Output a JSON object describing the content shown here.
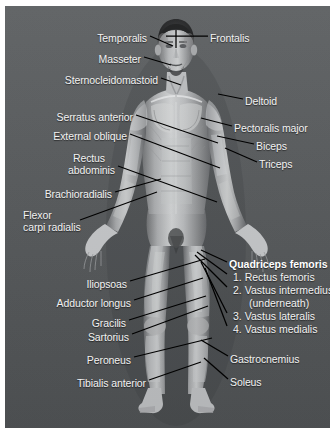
{
  "image": {
    "type": "anatomical-illustration",
    "subject": "human-muscular-system-anterior-view",
    "background_color": "#55585a",
    "border_color": "#ffffff",
    "label_color": "#f2f2f2",
    "leader_line_color": "#000000"
  },
  "labels": {
    "left": [
      {
        "id": "temporalis",
        "text": "Temporalis",
        "x": 142,
        "y": 26,
        "align": "right"
      },
      {
        "id": "masseter",
        "text": "Masseter",
        "x": 136,
        "y": 47,
        "align": "right"
      },
      {
        "id": "sternocleidomastoid",
        "text": "Sternocleidomastoid",
        "x": 153,
        "y": 68,
        "align": "right"
      },
      {
        "id": "serratus-anterior",
        "text": "Serratus anterior",
        "x": 128,
        "y": 105,
        "align": "right"
      },
      {
        "id": "external-oblique",
        "text": "External oblique",
        "x": 122,
        "y": 124,
        "align": "right"
      },
      {
        "id": "rectus-abdominis-1",
        "text": "Rectus",
        "x": 100,
        "y": 146,
        "align": "right"
      },
      {
        "id": "rectus-abdominis-2",
        "text": "abdominis",
        "x": 110,
        "y": 158,
        "align": "right"
      },
      {
        "id": "brachioradialis",
        "text": "Brachioradialis",
        "x": 107,
        "y": 182,
        "align": "right"
      },
      {
        "id": "flexor-carpi-1",
        "text": "Flexor",
        "x": 18,
        "y": 203,
        "align": "left"
      },
      {
        "id": "flexor-carpi-2",
        "text": "carpi radialis",
        "x": 18,
        "y": 215,
        "align": "left"
      },
      {
        "id": "iliopsoas",
        "text": "Iliopsoas",
        "x": 122,
        "y": 272,
        "align": "right"
      },
      {
        "id": "adductor-longus",
        "text": "Adductor longus",
        "x": 126,
        "y": 291,
        "align": "right"
      },
      {
        "id": "gracilis",
        "text": "Gracilis",
        "x": 121,
        "y": 311,
        "align": "right"
      },
      {
        "id": "sartorius",
        "text": "Sartorius",
        "x": 124,
        "y": 325,
        "align": "right"
      },
      {
        "id": "peroneus",
        "text": "Peroneus",
        "x": 126,
        "y": 348,
        "align": "right"
      },
      {
        "id": "tibialis-anterior",
        "text": "Tibialis anterior",
        "x": 141,
        "y": 371,
        "align": "right"
      }
    ],
    "right": [
      {
        "id": "frontalis",
        "text": "Frontalis",
        "x": 205,
        "y": 26,
        "align": "left"
      },
      {
        "id": "deltoid",
        "text": "Deltoid",
        "x": 240,
        "y": 89,
        "align": "left"
      },
      {
        "id": "pectoralis-major",
        "text": "Pectoralis major",
        "x": 229,
        "y": 116,
        "align": "left"
      },
      {
        "id": "biceps",
        "text": "Biceps",
        "x": 251,
        "y": 134,
        "align": "left"
      },
      {
        "id": "triceps",
        "text": "Triceps",
        "x": 254,
        "y": 152,
        "align": "left"
      },
      {
        "id": "gastrocnemius",
        "text": "Gastrocnemius",
        "x": 225,
        "y": 347,
        "align": "left"
      },
      {
        "id": "soleus",
        "text": "Soleus",
        "x": 225,
        "y": 370,
        "align": "left"
      }
    ],
    "group": {
      "title": "Quadriceps femoris",
      "title_x": 224,
      "title_y": 252,
      "items": [
        {
          "id": "rectus-femoris",
          "text": "1. Rectus femoris",
          "x": 228,
          "y": 265
        },
        {
          "id": "vastus-intermedius",
          "text": "2. Vastus intermedius",
          "x": 228,
          "y": 278
        },
        {
          "id": "vastus-intermedius-note",
          "text": "(underneath)",
          "x": 244,
          "y": 291
        },
        {
          "id": "vastus-lateralis",
          "text": "3. Vastus lateralis",
          "x": 228,
          "y": 304
        },
        {
          "id": "vastus-medialis",
          "text": "4. Vastus medialis",
          "x": 228,
          "y": 317
        }
      ]
    }
  },
  "leader_lines": [
    {
      "id": "line-temporalis",
      "x1": 145,
      "y1": 30,
      "x2": 168,
      "y2": 40
    },
    {
      "id": "line-frontalis",
      "x1": 203,
      "y1": 30,
      "x2": 161,
      "y2": 30
    },
    {
      "id": "line-frontalis-tick",
      "x1": 171,
      "y1": 24,
      "x2": 171,
      "y2": 42
    },
    {
      "id": "line-masseter",
      "x1": 139,
      "y1": 51,
      "x2": 166,
      "y2": 59
    },
    {
      "id": "line-sternocleidomastoid",
      "x1": 156,
      "y1": 72,
      "x2": 176,
      "y2": 79
    },
    {
      "id": "line-deltoid",
      "x1": 238,
      "y1": 93,
      "x2": 213,
      "y2": 88
    },
    {
      "id": "line-pectoralis",
      "x1": 227,
      "y1": 120,
      "x2": 196,
      "y2": 112
    },
    {
      "id": "line-biceps",
      "x1": 249,
      "y1": 138,
      "x2": 212,
      "y2": 130
    },
    {
      "id": "line-triceps",
      "x1": 252,
      "y1": 156,
      "x2": 220,
      "y2": 142
    },
    {
      "id": "line-serratus",
      "x1": 131,
      "y1": 109,
      "x2": 213,
      "y2": 137
    },
    {
      "id": "line-external-oblique",
      "x1": 125,
      "y1": 128,
      "x2": 215,
      "y2": 162
    },
    {
      "id": "line-rectus-abdominis",
      "x1": 113,
      "y1": 160,
      "x2": 212,
      "y2": 196
    },
    {
      "id": "line-brachioradialis",
      "x1": 110,
      "y1": 186,
      "x2": 156,
      "y2": 173
    },
    {
      "id": "line-flexor-carpi",
      "x1": 75,
      "y1": 214,
      "x2": 152,
      "y2": 186
    },
    {
      "id": "line-iliopsoas",
      "x1": 125,
      "y1": 275,
      "x2": 200,
      "y2": 253
    },
    {
      "id": "line-adductor-longus",
      "x1": 129,
      "y1": 294,
      "x2": 198,
      "y2": 272
    },
    {
      "id": "line-gracilis",
      "x1": 124,
      "y1": 314,
      "x2": 201,
      "y2": 290
    },
    {
      "id": "line-sartorius",
      "x1": 127,
      "y1": 328,
      "x2": 203,
      "y2": 300
    },
    {
      "id": "line-peroneus",
      "x1": 129,
      "y1": 351,
      "x2": 207,
      "y2": 332
    },
    {
      "id": "line-tibialis",
      "x1": 144,
      "y1": 374,
      "x2": 196,
      "y2": 356
    },
    {
      "id": "line-quad-1",
      "x1": 222,
      "y1": 256,
      "x2": 196,
      "y2": 244
    },
    {
      "id": "line-quad-2",
      "x1": 222,
      "y1": 268,
      "x2": 192,
      "y2": 246
    },
    {
      "id": "line-quad-3",
      "x1": 222,
      "y1": 281,
      "x2": 190,
      "y2": 249
    },
    {
      "id": "line-quad-4",
      "x1": 222,
      "y1": 307,
      "x2": 196,
      "y2": 256
    },
    {
      "id": "line-quad-5",
      "x1": 222,
      "y1": 320,
      "x2": 200,
      "y2": 262
    },
    {
      "id": "line-gastrocnemius",
      "x1": 223,
      "y1": 350,
      "x2": 196,
      "y2": 334
    },
    {
      "id": "line-soleus",
      "x1": 223,
      "y1": 373,
      "x2": 199,
      "y2": 352
    }
  ]
}
